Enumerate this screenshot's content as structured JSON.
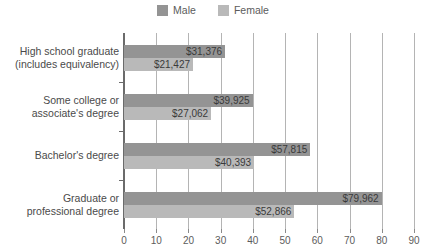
{
  "legend": {
    "position": "top-center",
    "items": [
      {
        "label": "Male",
        "color": "#949494",
        "swatch_name": "legend-swatch-male"
      },
      {
        "label": "Female",
        "color": "#b9b9b9",
        "swatch_name": "legend-swatch-female"
      }
    ]
  },
  "axis": {
    "x_ticks": [
      "0",
      "10",
      "20",
      "30",
      "40",
      "50",
      "60",
      "70",
      "80",
      "90"
    ],
    "x_min": 0,
    "x_max": 90,
    "x_step": 10
  },
  "chart_data": {
    "type": "bar",
    "orientation": "horizontal",
    "title": "",
    "subtitle": "",
    "xlabel": "",
    "ylabel": "",
    "xlim": [
      0,
      90
    ],
    "grid": true,
    "legend_position": "top-center",
    "categories": [
      "High school graduate (includes equivalency)",
      "Some college or associate's degree",
      "Bachelor's degree",
      "Graduate or professional degree"
    ],
    "category_lines": [
      [
        "High school graduate",
        "(includes equivalency)"
      ],
      [
        "Some college or",
        "associate's degree"
      ],
      [
        "Bachelor's degree"
      ],
      [
        "Graduate or",
        "professional degree"
      ]
    ],
    "series": [
      {
        "name": "Male",
        "color": "#949494",
        "values": [
          31.376,
          39.925,
          57.815,
          79.962
        ],
        "labels": [
          "$31,376",
          "$39,925",
          "$57,815",
          "$79,962"
        ]
      },
      {
        "name": "Female",
        "color": "#b9b9b9",
        "values": [
          21.427,
          27.062,
          40.393,
          52.866
        ],
        "labels": [
          "$21,427",
          "$27,062",
          "$40,393",
          "$52,866"
        ]
      }
    ],
    "value_unit": "thousands of dollars"
  },
  "colors": {
    "male": "#949494",
    "female": "#b9b9b9",
    "axis": "#6b6b6b",
    "grid": "#b4b4b4",
    "text": "#4a4a4a",
    "background": "#ffffff"
  }
}
